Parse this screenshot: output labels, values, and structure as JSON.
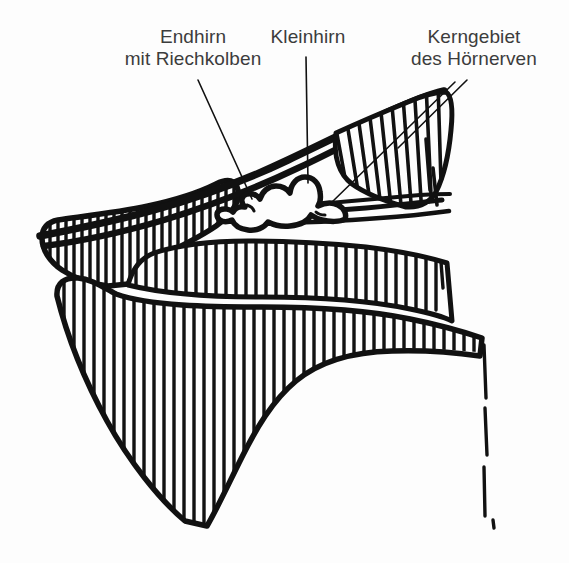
{
  "figure": {
    "width": 569,
    "height": 563,
    "background_color": "#fdfdfd",
    "ink_color": "#111111",
    "text_color": "#3c3c3c"
  },
  "labels": [
    {
      "id": "endhirn",
      "text": "Endhirn\nmit Riechkolben",
      "line1": "Endhirn",
      "line2": "mit Riechkolben"
    },
    {
      "id": "kleinhirn",
      "text": "Kleinhirn",
      "line1": "Kleinhirn",
      "line2": ""
    },
    {
      "id": "kerngebiet",
      "text": "Kerngebiet\ndes Hörnerven",
      "line1": "Kerngebiet",
      "line2": "des Hörnerven"
    }
  ],
  "leader_lines": [
    {
      "id": "endhirn-leader",
      "from_label": "Endhirn mit Riechkolben",
      "points": "198,80 252,199"
    },
    {
      "id": "kleinhirn-leader",
      "from_label": "Kleinhirn",
      "points": "306,57 308,183"
    },
    {
      "id": "kerngebiet-leader-upper",
      "from_label": "Kerngebiet des Hörnerven",
      "points": "466,80 399,148"
    },
    {
      "id": "kerngebiet-leader-lower",
      "from_label": "Kerngebiet des Hörnerven",
      "points": "455,82 330,203"
    }
  ],
  "structures": [
    {
      "id": "skull-roof-band",
      "name": "Schädeldach / obere Knochenspange",
      "hatched": false
    },
    {
      "id": "upper-hatched-wedge",
      "name": "Hinterer Schädelkeil (schraffiert)",
      "hatched": true
    },
    {
      "id": "upper-snout-band",
      "name": "Obere Schnauzenspange (schraffiert)",
      "hatched": true
    },
    {
      "id": "lower-jaw-body",
      "name": "Unterkiefer / Unterer Körper (schraffiert)",
      "hatched": true
    },
    {
      "id": "brain-outline",
      "name": "Gehirnumriss mit Riechkolben und Kleinhirn",
      "hatched": false
    },
    {
      "id": "nerve-strands",
      "name": "Nervenstränge nach rechts",
      "hatched": false
    }
  ]
}
